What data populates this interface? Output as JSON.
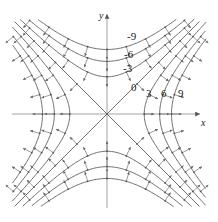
{
  "figure": {
    "title": "",
    "background": "#ffffff",
    "curve_color": "#4a4a4a",
    "axis_color": "#6b6b6b",
    "arrow_color": "#555555",
    "text_color": "#1a1a1a",
    "width": 218,
    "height": 222
  },
  "axes": {
    "x_label": "x",
    "y_label": "y",
    "origin_px": [
      107,
      114
    ],
    "scale_px_per_unit": 21.5,
    "xlim": [
      -4.4,
      4.6
    ],
    "ylim": [
      -4.3,
      4.4
    ],
    "grid": false,
    "x_axis_arrow": true,
    "y_axis_arrow": true
  },
  "chart_data": {
    "type": "line",
    "subtype": "contour-plot-with-gradient-field",
    "title": "",
    "xlabel": "x",
    "ylabel": "y",
    "function": "f(x, y) = x^2 - y^2",
    "xlim": [
      -4.4,
      4.6
    ],
    "ylim": [
      -4.3,
      4.4
    ],
    "grid": false,
    "legend": "none",
    "annotations": [
      {
        "text": "-9",
        "x": 1.3,
        "y": 3.55,
        "kind": "contour-label"
      },
      {
        "text": "-6",
        "x": 1.15,
        "y": 2.7,
        "kind": "contour-label"
      },
      {
        "text": "-3",
        "x": 1.1,
        "y": 2.05,
        "kind": "contour-label"
      },
      {
        "text": "0",
        "x": 1.25,
        "y": 1.15,
        "kind": "contour-label"
      },
      {
        "text": "3",
        "x": 1.95,
        "y": 0.85,
        "kind": "contour-label"
      },
      {
        "text": "6",
        "x": 2.65,
        "y": 0.85,
        "kind": "contour-label"
      },
      {
        "text": "9",
        "x": 3.45,
        "y": 0.85,
        "kind": "contour-label"
      },
      {
        "text": "y",
        "x": -0.3,
        "y": 4.2,
        "kind": "axis-label"
      },
      {
        "text": "x",
        "x": 4.35,
        "y": -0.45,
        "kind": "axis-label"
      }
    ],
    "contour_levels": [
      -9,
      -6,
      -3,
      0,
      3,
      6,
      9
    ],
    "series": [
      {
        "name": "level -9",
        "value": -9,
        "branches": [
          "upper",
          "lower"
        ],
        "type": "hyperbola",
        "opens": "y"
      },
      {
        "name": "level -6",
        "value": -6,
        "branches": [
          "upper",
          "lower"
        ],
        "type": "hyperbola",
        "opens": "y"
      },
      {
        "name": "level -3",
        "value": -3,
        "branches": [
          "upper",
          "lower"
        ],
        "type": "hyperbola",
        "opens": "y"
      },
      {
        "name": "level 0",
        "value": 0,
        "branches": [
          "line y=x",
          "line y=-x"
        ],
        "type": "asymptote-pair",
        "opens": "none"
      },
      {
        "name": "level 3",
        "value": 3,
        "branches": [
          "right",
          "left"
        ],
        "type": "hyperbola",
        "opens": "x"
      },
      {
        "name": "level 6",
        "value": 6,
        "branches": [
          "right",
          "left"
        ],
        "type": "hyperbola",
        "opens": "x"
      },
      {
        "name": "level 9",
        "value": 9,
        "branches": [
          "right",
          "left"
        ],
        "type": "hyperbola",
        "opens": "x"
      }
    ],
    "vector_field": {
      "name": "gradient",
      "formula": "grad f = (2x, -2y)",
      "description": "short arrows normal to each level curve, pointing toward increasing f"
    }
  },
  "labels": {
    "contour_neg9": "-9",
    "contour_neg6": "-6",
    "contour_neg3": "-3",
    "contour_0": "0",
    "contour_3": "3",
    "contour_6": "6",
    "contour_9": "9",
    "axis_x": "x",
    "axis_y": "y"
  }
}
